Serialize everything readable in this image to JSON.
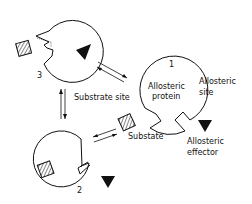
{
  "diagram": {
    "type": "allosteric-binding-scheme",
    "states": [
      {
        "id": "1",
        "label": "1",
        "description": "Allosteric protein, free"
      },
      {
        "id": "2",
        "label": "2",
        "description": "Protein with substrate bound"
      },
      {
        "id": "3",
        "label": "3",
        "description": "Protein with allosteric effector bound, substrate site altered"
      }
    ],
    "labels": {
      "protein_line1": "Allosteric",
      "protein_line2": "protein",
      "substrate_site": "Substrate site",
      "allosteric_site_line1": "Allosteric",
      "allosteric_site_line2": "site",
      "substrate": "Substate",
      "effector_line1": "Allosteric",
      "effector_line2": "effector"
    },
    "equilibria": [
      {
        "from": "3",
        "to": "1",
        "arrows": "reversible"
      },
      {
        "from": "1",
        "to": "2",
        "arrows": "reversible"
      },
      {
        "from": "3",
        "to": "2",
        "arrows": "reversible"
      }
    ],
    "colors": {
      "ink": "#111111",
      "background": "#ffffff"
    }
  }
}
